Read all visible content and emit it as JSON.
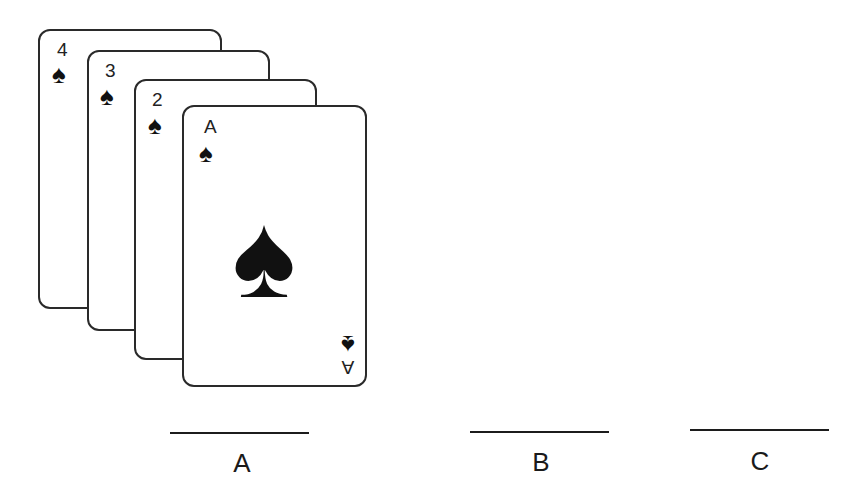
{
  "figure": {
    "cards": [
      {
        "rank": "4",
        "suit": "spade-icon",
        "suit_glyph": "♠"
      },
      {
        "rank": "3",
        "suit": "spade-icon",
        "suit_glyph": "♠"
      },
      {
        "rank": "2",
        "suit": "spade-icon",
        "suit_glyph": "♠"
      },
      {
        "rank": "A",
        "suit": "spade-icon",
        "suit_glyph": "♠"
      }
    ],
    "answer_blanks": [
      {
        "label": "A"
      },
      {
        "label": "B"
      },
      {
        "label": "C"
      }
    ]
  },
  "colors": {
    "ink": "#1a1a1a",
    "background": "#ffffff"
  }
}
